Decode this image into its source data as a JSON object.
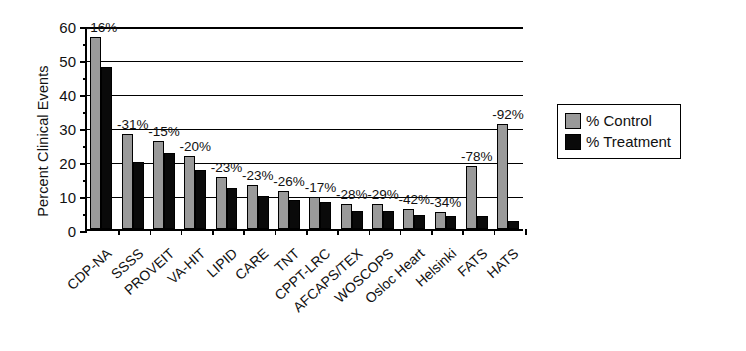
{
  "chart_data": {
    "type": "bar",
    "title": "",
    "xlabel": "",
    "ylabel": "Percent Clinical Events",
    "ylim": [
      0,
      60
    ],
    "yticks": [
      0,
      10,
      20,
      30,
      40,
      50,
      60
    ],
    "ytick_labels": [
      "0",
      "10",
      "20",
      "30",
      "40",
      "50",
      "60"
    ],
    "minor_yticks": [
      5,
      15,
      25,
      35,
      45,
      55
    ],
    "grid": true,
    "grid_axis": "y",
    "legend_position": "right",
    "categories": [
      "CDP-NA",
      "SSSS",
      "PROVEIT",
      "VA-HIT",
      "LIPID",
      "CARE",
      "TNT",
      "CPPT-LRC",
      "AFCAPS/TEX",
      "WOSCOPS",
      "Osloc Heart",
      "Helsinki",
      "FATS",
      "HATS"
    ],
    "series": [
      {
        "name": "% Control",
        "color": "#9a9a9a",
        "values": [
          56.5,
          28.0,
          26.0,
          21.5,
          15.4,
          12.8,
          11.3,
          9.5,
          7.5,
          7.5,
          6.0,
          5.0,
          18.5,
          31.0
        ]
      },
      {
        "name": "% Treatment",
        "color": "#0a0a0a",
        "values": [
          47.7,
          19.8,
          22.4,
          17.5,
          12.2,
          9.8,
          8.5,
          7.9,
          5.4,
          5.3,
          4.2,
          3.8,
          3.7,
          2.5
        ]
      }
    ],
    "annotations": [
      "-16%",
      "-31%",
      "-15%",
      "-20%",
      "-23%",
      "-23%",
      "-26%",
      "-17%",
      "-28%",
      "-29%",
      "-42%",
      "-34%",
      "-78%",
      "-92%"
    ]
  },
  "legend": {
    "entries": [
      {
        "label": "% Control",
        "swatch": "control"
      },
      {
        "label": "% Treatment",
        "swatch": "treatment"
      }
    ]
  },
  "colors": {
    "control": "#9a9a9a",
    "treatment": "#0a0a0a",
    "axis": "#000000",
    "background": "#ffffff"
  }
}
